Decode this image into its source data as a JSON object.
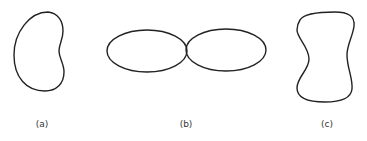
{
  "figure": {
    "panels": [
      {
        "id": "a",
        "label": "(a)",
        "shape": "kidney-bean closed curve"
      },
      {
        "id": "b",
        "label": "(b)",
        "shape": "two tangent ellipses (figure-eight)"
      },
      {
        "id": "c",
        "label": "(c)",
        "shape": "peanut / hourglass closed curve"
      }
    ],
    "stroke_color": "#222222",
    "background": "#ffffff"
  }
}
